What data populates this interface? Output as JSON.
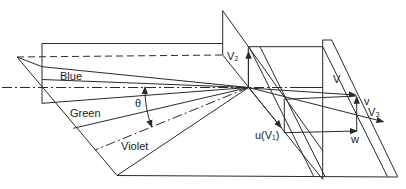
{
  "diagram": {
    "type": "wireframe-vector-diagram",
    "labels": {
      "blue": "Blue",
      "green": "Green",
      "violet": "Violet",
      "theta": "θ",
      "v2": "V₂",
      "V": "V",
      "v": "v",
      "v3": "V₃",
      "u_v1": "u(V₁)",
      "w": "w"
    },
    "colors": {
      "line": "#2b2b2b",
      "background": "#ffffff",
      "text": "#1c1c1c"
    }
  }
}
